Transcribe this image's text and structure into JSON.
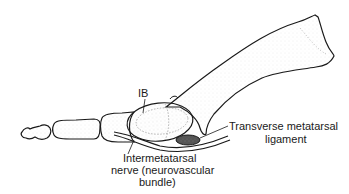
{
  "diagram": {
    "labels": {
      "ib": "IB",
      "ligament_line1": "Transverse metatarsal",
      "ligament_line2": "ligament",
      "nerve_line1": "Intermetatarsal",
      "nerve_line2": "nerve (neurovascular",
      "nerve_line3": "bundle)"
    },
    "colors": {
      "line": "#1a1a1a",
      "stipple": "#8a8a8a",
      "background": "#ffffff"
    }
  }
}
